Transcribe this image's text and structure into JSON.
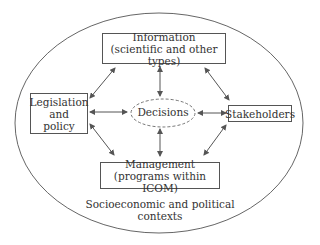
{
  "diagram": {
    "context_label": "Socioeconomic and political contexts",
    "center": {
      "label": "Decisions"
    },
    "nodes": {
      "information": {
        "line1": "Information",
        "line2": "(scientific and other types)"
      },
      "legislation": {
        "line1": "Legislation",
        "line2": "and",
        "line3": "policy"
      },
      "stakeholders": {
        "line1": "Stakeholders"
      },
      "management": {
        "line1": "Management",
        "line2": "(programs within ICOM)"
      }
    },
    "edges": [
      {
        "from": "information",
        "to": "legislation",
        "type": "bidirectional"
      },
      {
        "from": "information",
        "to": "decisions",
        "type": "bidirectional"
      },
      {
        "from": "information",
        "to": "stakeholders",
        "type": "bidirectional"
      },
      {
        "from": "legislation",
        "to": "decisions",
        "type": "bidirectional"
      },
      {
        "from": "stakeholders",
        "to": "decisions",
        "type": "bidirectional"
      },
      {
        "from": "legislation",
        "to": "management",
        "type": "bidirectional"
      },
      {
        "from": "decisions",
        "to": "management",
        "type": "bidirectional"
      },
      {
        "from": "stakeholders",
        "to": "management",
        "type": "bidirectional"
      }
    ]
  }
}
